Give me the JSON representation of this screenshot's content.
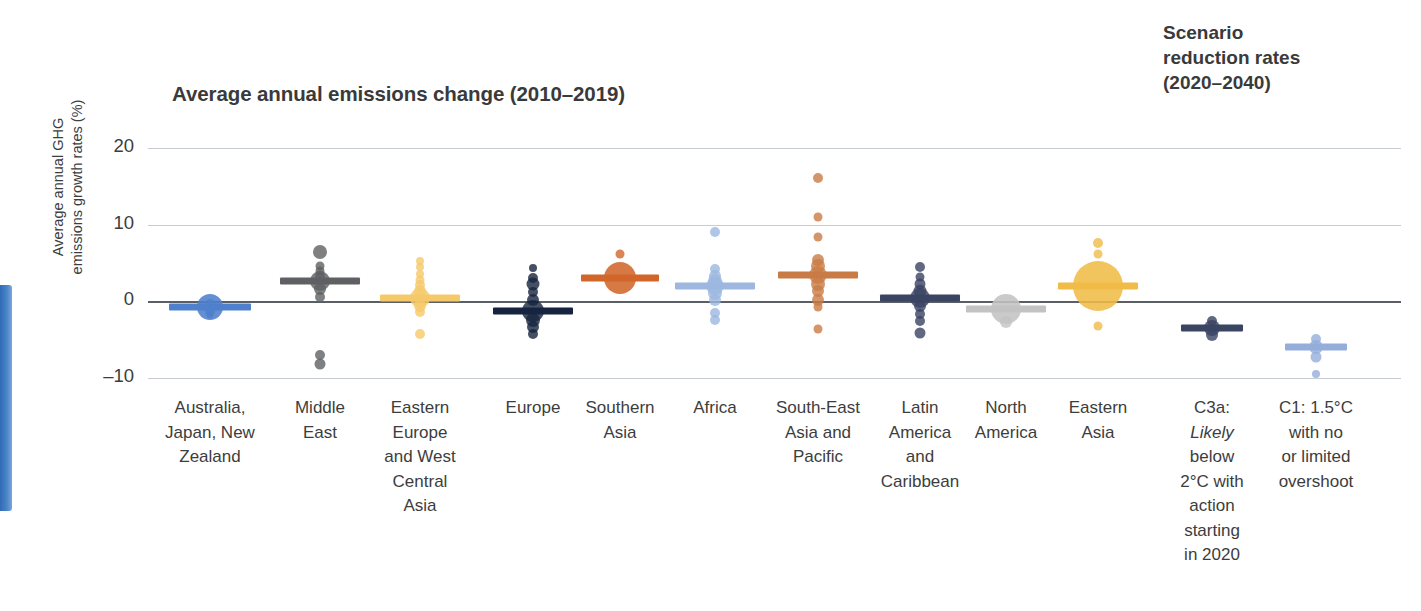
{
  "chart_data": {
    "type": "scatter",
    "title": "Average annual emissions change (2010–2019)",
    "secondary_title_lines": [
      "Scenario",
      "reduction rates",
      "(2020–2040)"
    ],
    "ylabel_lines": [
      "Average annual GHG",
      "emissions growth rates (%)"
    ],
    "xlabel": "",
    "ylim": [
      -12.5,
      20
    ],
    "yticks": [
      20,
      10,
      0,
      -10
    ],
    "ytick_labels": [
      "20",
      "10",
      "0",
      "–10"
    ],
    "grid": true,
    "zero_line": true,
    "legend": "none",
    "series": [
      {
        "name": "Australia, Japan, New Zealand",
        "label_lines": [
          "Australia,",
          "Japan, New",
          "Zealand"
        ],
        "color": "#4e80cc",
        "group": "region",
        "median": -0.7,
        "bubble": 13,
        "points": [
          {
            "v": -0.7,
            "r": 13
          },
          {
            "v": -0.3,
            "r": 5
          },
          {
            "v": -1.2,
            "r": 5
          },
          {
            "v": -1.8,
            "r": 3.5
          }
        ]
      },
      {
        "name": "Middle East",
        "label_lines": [
          "Middle",
          "East"
        ],
        "color": "#5e6063",
        "group": "region",
        "median": 2.6,
        "bubble": 10,
        "points": [
          {
            "v": 6.5,
            "r": 7
          },
          {
            "v": 4.6,
            "r": 4.5
          },
          {
            "v": 3.9,
            "r": 4.5
          },
          {
            "v": 3.3,
            "r": 5
          },
          {
            "v": 2.6,
            "r": 10
          },
          {
            "v": 1.6,
            "r": 6
          },
          {
            "v": 0.6,
            "r": 5
          },
          {
            "v": -7.0,
            "r": 5
          },
          {
            "v": -8.2,
            "r": 5.5
          }
        ]
      },
      {
        "name": "Eastern Europe and West Central Asia",
        "label_lines": [
          "Eastern",
          "Europe",
          "and West",
          "Central",
          "Asia"
        ],
        "color": "#f5c96a",
        "group": "region",
        "median": 0.4,
        "bubble": 10,
        "points": [
          {
            "v": 5.3,
            "r": 4
          },
          {
            "v": 4.5,
            "r": 4
          },
          {
            "v": 3.6,
            "r": 4
          },
          {
            "v": 2.8,
            "r": 4.5
          },
          {
            "v": 2.1,
            "r": 5
          },
          {
            "v": 1.3,
            "r": 6
          },
          {
            "v": 0.4,
            "r": 10
          },
          {
            "v": -0.6,
            "r": 6
          },
          {
            "v": -1.4,
            "r": 5
          },
          {
            "v": -4.2,
            "r": 5
          }
        ]
      },
      {
        "name": "Europe",
        "label_lines": [
          "Europe"
        ],
        "color": "#17243f",
        "group": "region",
        "median": -1.3,
        "bubble": 11,
        "points": [
          {
            "v": 4.4,
            "r": 4
          },
          {
            "v": 3.1,
            "r": 5
          },
          {
            "v": 2.2,
            "r": 6.5
          },
          {
            "v": 1.2,
            "r": 5
          },
          {
            "v": 0.2,
            "r": 6
          },
          {
            "v": -1.3,
            "r": 11
          },
          {
            "v": -2.4,
            "r": 7
          },
          {
            "v": -3.4,
            "r": 6
          },
          {
            "v": -4.3,
            "r": 5
          }
        ]
      },
      {
        "name": "Southern Asia",
        "label_lines": [
          "Southern",
          "Asia"
        ],
        "color": "#d2662a",
        "group": "region",
        "median": 3.1,
        "bubble": 16,
        "points": [
          {
            "v": 6.2,
            "r": 4.5
          },
          {
            "v": 3.1,
            "r": 16
          }
        ]
      },
      {
        "name": "Africa",
        "label_lines": [
          "Africa"
        ],
        "color": "#9cb8e0",
        "group": "region",
        "median": 2.0,
        "bubble": 9,
        "points": [
          {
            "v": 9.1,
            "r": 5
          },
          {
            "v": 4.2,
            "r": 5
          },
          {
            "v": 3.3,
            "r": 6
          },
          {
            "v": 2.6,
            "r": 7
          },
          {
            "v": 2.0,
            "r": 9
          },
          {
            "v": 1.1,
            "r": 7
          },
          {
            "v": 0.2,
            "r": 6
          },
          {
            "v": -1.5,
            "r": 5
          },
          {
            "v": -2.4,
            "r": 5
          }
        ]
      },
      {
        "name": "South-East Asia and Pacific",
        "label_lines": [
          "South-East",
          "Asia and",
          "Pacific"
        ],
        "color": "#c97b45",
        "group": "region",
        "median": 3.4,
        "bubble": 9,
        "points": [
          {
            "v": 16.1,
            "r": 5
          },
          {
            "v": 11.0,
            "r": 4.5
          },
          {
            "v": 8.4,
            "r": 4.5
          },
          {
            "v": 5.4,
            "r": 6
          },
          {
            "v": 4.6,
            "r": 7
          },
          {
            "v": 3.4,
            "r": 9
          },
          {
            "v": 2.3,
            "r": 7
          },
          {
            "v": 1.3,
            "r": 6
          },
          {
            "v": 0.2,
            "r": 6
          },
          {
            "v": -0.8,
            "r": 4.5
          },
          {
            "v": -3.6,
            "r": 4.5
          }
        ]
      },
      {
        "name": "Latin America and Caribbean",
        "label_lines": [
          "Latin",
          "America",
          "and",
          "Caribbean"
        ],
        "color": "#3a4463",
        "group": "region",
        "median": 0.5,
        "bubble": 10,
        "points": [
          {
            "v": 4.5,
            "r": 5
          },
          {
            "v": 3.2,
            "r": 4.5
          },
          {
            "v": 2.2,
            "r": 5.5
          },
          {
            "v": 1.3,
            "r": 6.5
          },
          {
            "v": 0.5,
            "r": 10
          },
          {
            "v": -0.6,
            "r": 6
          },
          {
            "v": -1.6,
            "r": 5
          },
          {
            "v": -2.6,
            "r": 5
          },
          {
            "v": -4.1,
            "r": 5.5
          }
        ]
      },
      {
        "name": "North America",
        "label_lines": [
          "North",
          "America"
        ],
        "color": "#c3c3c3",
        "group": "region",
        "median": -1.0,
        "bubble": 15,
        "points": [
          {
            "v": -1.0,
            "r": 15
          },
          {
            "v": -2.7,
            "r": 6
          }
        ]
      },
      {
        "name": "Eastern Asia",
        "label_lines": [
          "Eastern",
          "Asia"
        ],
        "color": "#f0bc47",
        "group": "region",
        "median": 2.0,
        "bubble": 25,
        "points": [
          {
            "v": 7.6,
            "r": 5
          },
          {
            "v": 6.2,
            "r": 4.5
          },
          {
            "v": 2.0,
            "r": 25
          },
          {
            "v": -3.2,
            "r": 4.5
          }
        ]
      },
      {
        "name": "C3a: Likely below 2°C with action starting in 2020",
        "label_lines": [
          "C3a:",
          "@Likely",
          "below",
          "2°C with",
          "action",
          "starting",
          "in 2020"
        ],
        "color": "#3a4463",
        "group": "scenario",
        "median": -3.5,
        "bubble": 8,
        "points": [
          {
            "v": -2.6,
            "r": 5
          },
          {
            "v": -3.5,
            "r": 8
          },
          {
            "v": -4.4,
            "r": 6
          }
        ]
      },
      {
        "name": "C1: 1.5°C with no or limited overshoot",
        "label_lines": [
          "C1: 1.5°C",
          "with no",
          "or limited",
          "overshoot"
        ],
        "color": "#93aedb",
        "group": "scenario",
        "median": -6.0,
        "bubble": 7,
        "points": [
          {
            "v": -4.9,
            "r": 5
          },
          {
            "v": -6.0,
            "r": 7
          },
          {
            "v": -7.2,
            "r": 5.5
          },
          {
            "v": -9.5,
            "r": 4
          }
        ]
      }
    ]
  }
}
